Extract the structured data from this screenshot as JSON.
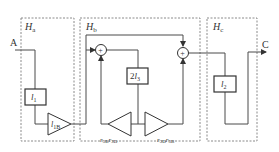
{
  "diagram": {
    "blocks": {
      "ha": {
        "label": "H",
        "sub": "a"
      },
      "hb": {
        "label": "H",
        "sub": "b"
      },
      "hc": {
        "label": "H",
        "sub": "c"
      }
    },
    "io": {
      "input": "A",
      "output": "C"
    },
    "elements": {
      "l1": {
        "main": "l",
        "sub": "1"
      },
      "l1b": {
        "main": "l",
        "sub": "1B"
      },
      "two_l3": {
        "coef": "2",
        "main": "l",
        "sub": "3"
      },
      "r3b_r3d": {
        "a": "r",
        "asub": "3B",
        "b": "r",
        "bsub": "3D"
      },
      "r3d_r3b": {
        "a": "r",
        "asub": "3D",
        "b": "r",
        "bsub": "3B"
      },
      "l2": {
        "main": "l",
        "sub": "2"
      },
      "sum_symbol": "+"
    },
    "colors": {
      "line": "#4a4a4a",
      "dashed": "#8a8a8a",
      "text": "#333333"
    }
  }
}
